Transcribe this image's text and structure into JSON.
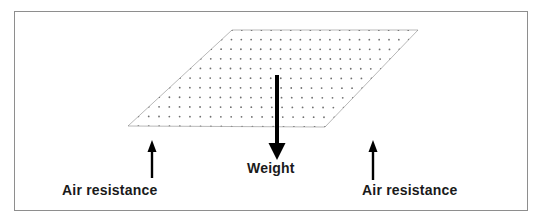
{
  "canvas": {
    "width": 543,
    "height": 222,
    "background": "#ffffff",
    "frame_color": "#8e8e8e"
  },
  "diagram": {
    "plane": {
      "name": "horizontal-sheet",
      "outline_color": "#b9b9b9",
      "fill": "#ffffff",
      "dot_color": "#707070",
      "vertices": [
        {
          "x": 232,
          "y": 30
        },
        {
          "x": 418,
          "y": 30
        },
        {
          "x": 325,
          "y": 127
        },
        {
          "x": 128,
          "y": 126
        }
      ],
      "grid": {
        "columns": 19,
        "rows": 10,
        "dot_radius": 0.9
      }
    },
    "arrows": [
      {
        "name": "weight-arrow",
        "direction": "down",
        "color": "#000000",
        "shaft_width": 4,
        "x": 277,
        "y_start": 75,
        "y_end": 160,
        "head_width": 17,
        "head_length": 17
      },
      {
        "name": "air-resistance-arrow-left",
        "direction": "up",
        "color": "#000000",
        "shaft_width": 2.4,
        "x": 152,
        "y_start": 178,
        "y_end": 140,
        "head_width": 9,
        "head_length": 12
      },
      {
        "name": "air-resistance-arrow-right",
        "direction": "up",
        "color": "#000000",
        "shaft_width": 2.4,
        "x": 373,
        "y_start": 180,
        "y_end": 140,
        "head_width": 9,
        "head_length": 12
      }
    ]
  },
  "labels": {
    "weight": "Weight",
    "air_resistance_left": "Air resistance",
    "air_resistance_right": "Air resistance"
  }
}
